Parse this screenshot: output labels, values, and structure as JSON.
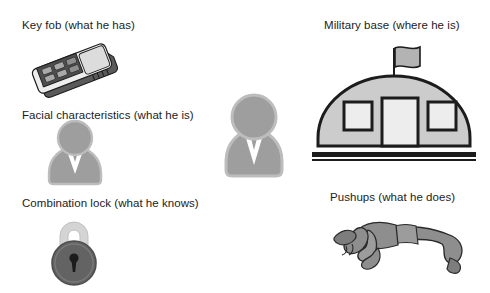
{
  "diagram": {
    "background_color": "#ffffff",
    "text_color": "#1c1c1c",
    "items": [
      {
        "id": "key-fob",
        "label": "Key fob (what he has)",
        "factor": "what he has",
        "icon": "key-fob-icon",
        "column": "left",
        "colors": {
          "body_light": "#e8e8e8",
          "body_mid": "#b9b9b9",
          "panel_dark": "#4a4a4a",
          "outline": "#1c1c1c"
        }
      },
      {
        "id": "facial-characteristics",
        "label": "Facial characteristics (what he is)",
        "factor": "what he is",
        "icon": "person-silhouette-icon",
        "column": "left",
        "colors": {
          "fill": "#9a9a9a",
          "outline": "#b5b5b5",
          "collar": "#ffffff"
        }
      },
      {
        "id": "combination-lock",
        "label": "Combination lock (what he knows)",
        "factor": "what he knows",
        "icon": "padlock-icon",
        "column": "left",
        "colors": {
          "shackle": "#d2d2d2",
          "body": "#636363",
          "keyhole": "#1c1c1c"
        }
      },
      {
        "id": "military-base",
        "label": "Military base (where he is)",
        "factor": "where he is",
        "icon": "military-base-icon",
        "column": "right",
        "colors": {
          "dome": "#c9c9c9",
          "window": "#ececec",
          "flag": "#b0b0b0",
          "outline": "#1c1c1c"
        }
      },
      {
        "id": "pushups",
        "label": "Pushups (what he does)",
        "factor": "what he does",
        "icon": "pushup-person-icon",
        "column": "right",
        "colors": {
          "body": "#8e8e8e",
          "shade": "#6f6f6f",
          "outline": "#2a2a2a"
        }
      },
      {
        "id": "subject",
        "label": "",
        "factor": "subject",
        "icon": "person-silhouette-icon",
        "column": "center",
        "colors": {
          "fill": "#9a9a9a",
          "outline": "#b5b5b5",
          "collar": "#ffffff"
        }
      }
    ]
  }
}
